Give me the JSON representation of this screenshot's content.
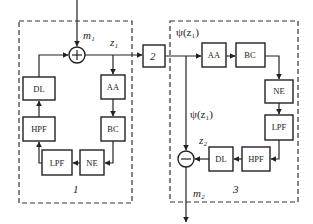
{
  "diagram": {
    "subsystem_1": {
      "label": "1",
      "blocks": {
        "dl": "DL",
        "aa": "AA",
        "hpf": "HPF",
        "bc": "BC",
        "lpf": "LPF",
        "ne": "NE"
      },
      "sum_symbol": "+",
      "input_label": "m₁",
      "output_label": "z₁"
    },
    "channel": {
      "label": "2"
    },
    "subsystem_3": {
      "label": "3",
      "input_label": "ψ(z₁)",
      "branch_label": "ψ(z₁)",
      "blocks": {
        "aa": "AA",
        "bc": "BC",
        "ne": "NE",
        "lpf": "LPF",
        "hpf": "HPF",
        "dl": "DL"
      },
      "diff_symbol": "−",
      "feedback_label": "z₂",
      "output_label": "m₂"
    }
  }
}
